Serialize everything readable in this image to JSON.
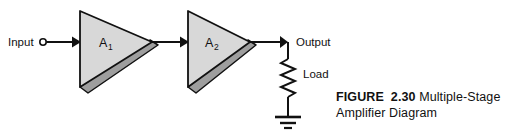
{
  "figure": {
    "background_color": "#ffffff",
    "line_color": "#111111",
    "amp_fill_color": "#d8d8d8",
    "amp_bevel_color": "#9e9e9e",
    "caption": {
      "prefix": "FIGURE",
      "number": "2.30",
      "title_line1": "Multiple-Stage",
      "title_line2": "Amplifier Diagram"
    },
    "terminals": {
      "input_label": "Input",
      "output_label": "Output",
      "load_label": "Load"
    },
    "stages": [
      {
        "label_main": "A",
        "label_sub": "1"
      },
      {
        "label_main": "A",
        "label_sub": "2"
      }
    ]
  }
}
